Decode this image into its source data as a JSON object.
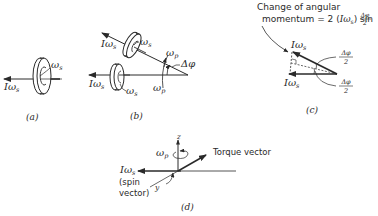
{
  "figure": {
    "panels": [
      {
        "id": "a",
        "caption": "(a)",
        "labels": {
          "angular_momentum": "Iω",
          "angular_momentum_sub": "s",
          "spin": "ω",
          "spin_sub": "s"
        }
      },
      {
        "id": "b",
        "caption": "(b)",
        "labels": {
          "upper_angular_momentum": "Iω",
          "upper_angular_momentum_sub": "s",
          "upper_spin": "ω",
          "upper_spin_sub": "s",
          "lower_angular_momentum": "Iω",
          "lower_angular_momentum_sub": "s",
          "lower_spin": "ω",
          "lower_spin_sub": "s",
          "precession_upper": "ω",
          "precession_upper_sub": "p",
          "precession_lower": "ω",
          "precession_lower_sub": "p",
          "angle": "Δφ"
        }
      },
      {
        "id": "c",
        "caption": "(c)",
        "title_line1": "Change of angular",
        "title_line2_prefix": "momentum  = 2 (",
        "title_line2_sym": "Iω",
        "title_line2_sub": "s",
        "title_line2_suffix": ") sin",
        "frac_num": "Δφ",
        "frac_den": "2",
        "labels": {
          "upper_vec": "Iω",
          "upper_vec_sub": "s",
          "lower_vec": "Iω",
          "lower_vec_sub": "s",
          "half_angle_upper_num": "Δφ",
          "half_angle_upper_den": "2",
          "half_angle_lower_num": "Δφ",
          "half_angle_lower_den": "2"
        }
      },
      {
        "id": "d",
        "caption": "(d)",
        "labels": {
          "z_axis": "z",
          "y_axis": "y",
          "precession": "ω",
          "precession_sub": "p",
          "torque": "Torque vector",
          "spin_vec": "Iω",
          "spin_vec_sub": "s",
          "spin_note_line1": "(spin",
          "spin_note_line2": "vector)"
        }
      }
    ]
  }
}
